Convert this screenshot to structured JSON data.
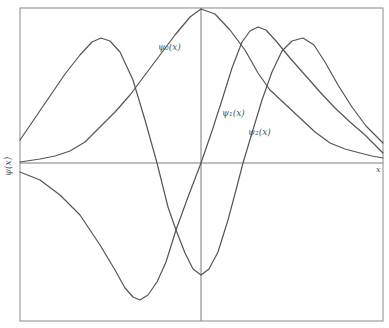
{
  "chart_data": {
    "type": "line",
    "title": "",
    "xlabel": "x",
    "ylabel": "ψ(x)",
    "grid": false,
    "legend": "inline labels",
    "frame_px": {
      "left": 20,
      "top": 8,
      "right": 383,
      "bottom": 321
    },
    "axis_px": {
      "y_zero": 163,
      "x_center": 201
    },
    "series": [
      {
        "name": "ψ0(x)",
        "label_pos": [
          158,
          48
        ],
        "points": [
          [
            20,
            162
          ],
          [
            40,
            159
          ],
          [
            55,
            156
          ],
          [
            70,
            151
          ],
          [
            85,
            142
          ],
          [
            100,
            127
          ],
          [
            115,
            112
          ],
          [
            130,
            95
          ],
          [
            145,
            75
          ],
          [
            160,
            55
          ],
          [
            175,
            35
          ],
          [
            190,
            17
          ],
          [
            201,
            9
          ],
          [
            215,
            14
          ],
          [
            230,
            30
          ],
          [
            245,
            50
          ],
          [
            258,
            73
          ],
          [
            270,
            90
          ],
          [
            285,
            104
          ],
          [
            300,
            118
          ],
          [
            315,
            132
          ],
          [
            330,
            143
          ],
          [
            345,
            149
          ],
          [
            360,
            153
          ],
          [
            372,
            156
          ],
          [
            383,
            158
          ]
        ]
      },
      {
        "name": "ψ1(x)",
        "label_pos": [
          222,
          114
        ],
        "points": [
          [
            20,
            172
          ],
          [
            40,
            180
          ],
          [
            60,
            195
          ],
          [
            80,
            215
          ],
          [
            100,
            245
          ],
          [
            115,
            270
          ],
          [
            125,
            288
          ],
          [
            133,
            297
          ],
          [
            140,
            300
          ],
          [
            148,
            295
          ],
          [
            157,
            282
          ],
          [
            166,
            262
          ],
          [
            176,
            230
          ],
          [
            188,
            197
          ],
          [
            201,
            163
          ],
          [
            212,
            131
          ],
          [
            222,
            100
          ],
          [
            232,
            68
          ],
          [
            242,
            42
          ],
          [
            250,
            31
          ],
          [
            258,
            27
          ],
          [
            266,
            30
          ],
          [
            276,
            41
          ],
          [
            290,
            58
          ],
          [
            305,
            75
          ],
          [
            320,
            92
          ],
          [
            335,
            108
          ],
          [
            350,
            122
          ],
          [
            365,
            135
          ],
          [
            383,
            153
          ]
        ]
      },
      {
        "name": "ψ2(x)",
        "label_pos": [
          248,
          133
        ],
        "points": [
          [
            20,
            140
          ],
          [
            35,
            118
          ],
          [
            50,
            96
          ],
          [
            65,
            74
          ],
          [
            80,
            55
          ],
          [
            92,
            42
          ],
          [
            101,
            38
          ],
          [
            110,
            41
          ],
          [
            120,
            52
          ],
          [
            133,
            80
          ],
          [
            145,
            120
          ],
          [
            157,
            163
          ],
          [
            168,
            207
          ],
          [
            176,
            230
          ],
          [
            185,
            253
          ],
          [
            193,
            269
          ],
          [
            201,
            275
          ],
          [
            209,
            269
          ],
          [
            218,
            252
          ],
          [
            228,
            220
          ],
          [
            236,
            190
          ],
          [
            243,
            163
          ],
          [
            252,
            133
          ],
          [
            262,
            100
          ],
          [
            272,
            72
          ],
          [
            282,
            51
          ],
          [
            292,
            41
          ],
          [
            303,
            38
          ],
          [
            314,
            45
          ],
          [
            325,
            62
          ],
          [
            338,
            85
          ],
          [
            352,
            107
          ],
          [
            366,
            126
          ],
          [
            383,
            143
          ]
        ]
      }
    ]
  },
  "labels": {
    "psi0": "ψ₀(x)",
    "psi1": "ψ₁(x)",
    "psi2": "ψ₂(x)",
    "x_axis": "x",
    "y_axis": "ψ(x)"
  }
}
